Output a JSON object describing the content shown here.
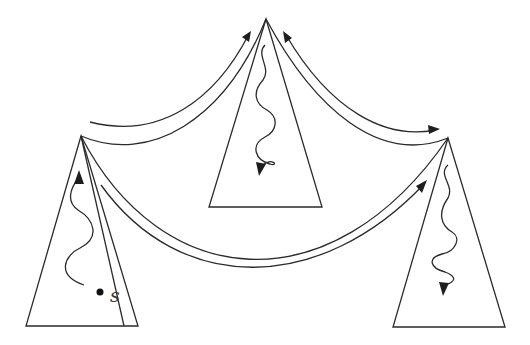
{
  "diagram": {
    "type": "tree-diagram",
    "colors": {
      "background": "#ffffff",
      "stroke": "#2a2a2a"
    },
    "nodes": [
      {
        "id": "left-triangle",
        "apex": [
          81,
          136
        ],
        "base_y": 326,
        "base_x": [
          26,
          138
        ],
        "wavy_arrow_direction": "up"
      },
      {
        "id": "top-triangle",
        "apex": [
          266,
          19
        ],
        "base_y": 207,
        "base_x": [
          209,
          322
        ],
        "wavy_arrow_direction": "down"
      },
      {
        "id": "right-triangle",
        "apex": [
          448,
          138
        ],
        "base_y": 327,
        "base_x": [
          393,
          505
        ],
        "wavy_arrow_direction": "down"
      }
    ],
    "edges": [
      {
        "from": "left-triangle",
        "to": "top-triangle",
        "arrow_at": "top-triangle"
      },
      {
        "from": "top-triangle",
        "to": "right-triangle",
        "arrow_at": "both"
      },
      {
        "from": "left-triangle",
        "to": "right-triangle",
        "arrow_at": "right-triangle"
      }
    ],
    "source_point": {
      "label": "s",
      "position": [
        100,
        292
      ]
    }
  }
}
